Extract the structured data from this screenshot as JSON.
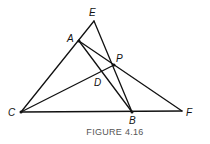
{
  "figure": {
    "caption": "FIGURE 4.16",
    "points": {
      "E": {
        "label": "E",
        "x": 94,
        "y": 21
      },
      "A": {
        "label": "A",
        "x": 79,
        "y": 41
      },
      "P": {
        "label": "P",
        "x": 114,
        "y": 65
      },
      "D": {
        "label": "D",
        "x": 101,
        "y": 71
      },
      "C": {
        "label": "C",
        "x": 21,
        "y": 112
      },
      "B": {
        "label": "B",
        "x": 132,
        "y": 112
      },
      "F": {
        "label": "F",
        "x": 182,
        "y": 111
      }
    },
    "segments": [
      [
        "C",
        "E"
      ],
      [
        "E",
        "B"
      ],
      [
        "A",
        "B"
      ],
      [
        "A",
        "F"
      ],
      [
        "C",
        "F"
      ],
      [
        "C",
        "P"
      ]
    ],
    "colors": {
      "line": "#111111",
      "caption": "#555555",
      "background": "#ffffff"
    }
  }
}
